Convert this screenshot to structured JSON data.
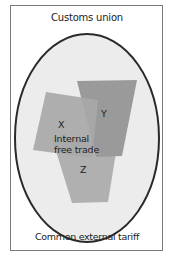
{
  "title": "Customs union",
  "bottom_label": "Common external tariff",
  "center_label_line1": "Internal",
  "center_label_line2": "free trade",
  "members": [
    {
      "id": "X",
      "label": "X",
      "color": "#a8a8a8"
    },
    {
      "id": "Y",
      "label": "Y",
      "color": "#9a9a9a"
    },
    {
      "id": "Z",
      "label": "Z",
      "color": "#b0b0b0"
    }
  ],
  "colors": {
    "frame_border": "#7a7a7a",
    "ellipse_fill": "#ececec",
    "ellipse_stroke": "#2a2a2a",
    "text": "#222222"
  }
}
